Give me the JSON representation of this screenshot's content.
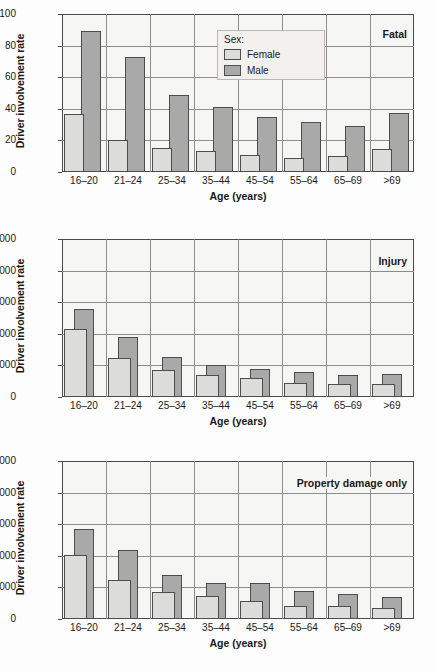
{
  "figure": {
    "axis_x_title": "Age (years)",
    "axis_y_title": "Driver involvement rate",
    "legend_title": "Sex:",
    "legend_female": "Female",
    "legend_male": "Male",
    "colors": {
      "female_fill": "#dcdcda",
      "male_fill": "#a9a9a9",
      "bar_stroke": "#4d4d4d",
      "grid": "#8c8c8c",
      "plot_bg": "#f6f6f4",
      "axis": "#4a4a4a"
    }
  },
  "chart_data": [
    {
      "type": "bar",
      "title": "Fatal",
      "xlabel": "Age (years)",
      "ylabel": "Driver involvement rate",
      "categories": [
        "16–20",
        "21–24",
        "25–34",
        "35–44",
        "45–54",
        "55–64",
        "65–69",
        ">69"
      ],
      "ylim": [
        0,
        100
      ],
      "yticks": [
        0,
        20,
        40,
        60,
        80,
        100
      ],
      "ytick_labels": [
        "0",
        "20",
        "40",
        "60",
        "80",
        "100"
      ],
      "grid": true,
      "legend_position": "top-center",
      "series": [
        {
          "name": "Female",
          "values": [
            37,
            20,
            15,
            13.5,
            10.5,
            9,
            10,
            14.5
          ]
        },
        {
          "name": "Male",
          "values": [
            89,
            73,
            49,
            41,
            35,
            31.5,
            29,
            37.5
          ]
        }
      ]
    },
    {
      "type": "bar",
      "title": "Injury",
      "xlabel": "Age (years)",
      "ylabel": "Driver involvement rate",
      "categories": [
        "16–20",
        "21–24",
        "25–34",
        "35–44",
        "45–54",
        "55–64",
        "65–69",
        ">69"
      ],
      "ylim": [
        0,
        10000
      ],
      "yticks": [
        0,
        2000,
        4000,
        6000,
        8000,
        10000
      ],
      "ytick_labels": [
        "0",
        "2,000",
        "4,000",
        "6,000",
        "8,000",
        "10,000"
      ],
      "grid": true,
      "legend_position": "none",
      "series": [
        {
          "name": "Female",
          "values": [
            4300,
            2500,
            1700,
            1400,
            1200,
            900,
            850,
            800
          ]
        },
        {
          "name": "Male",
          "values": [
            5550,
            3800,
            2550,
            2050,
            1750,
            1600,
            1400,
            1450
          ]
        }
      ]
    },
    {
      "type": "bar",
      "title": "Property damage only",
      "xlabel": "Age (years)",
      "ylabel": "Driver involvement rate",
      "categories": [
        "16–20",
        "21–24",
        "25–34",
        "35–44",
        "45–54",
        "55–64",
        "65–69",
        ">69"
      ],
      "ylim": [
        0,
        20000
      ],
      "yticks": [
        0,
        4000,
        8000,
        12000,
        16000,
        20000
      ],
      "ytick_labels": [
        "0",
        "4,000",
        "8,000",
        "12,000",
        "16,000",
        "20,000"
      ],
      "grid": true,
      "legend_position": "none",
      "series": [
        {
          "name": "Female",
          "values": [
            8150,
            5000,
            3450,
            2900,
            2250,
            1600,
            1600,
            1350
          ]
        },
        {
          "name": "Male",
          "values": [
            11350,
            8750,
            5550,
            4600,
            4550,
            3600,
            3150,
            2800
          ]
        }
      ]
    }
  ]
}
